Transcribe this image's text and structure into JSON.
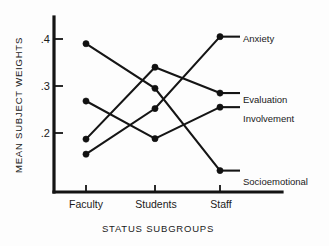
{
  "chart_data": {
    "type": "line",
    "title": "",
    "xlabel": "STATUS  SUBGROUPS",
    "ylabel": "MEAN  SUBJECT  WEIGHTS",
    "categories": [
      "Faculty",
      "Students",
      "Staff"
    ],
    "ytick_labels": [
      ".4",
      ".3",
      ".2"
    ],
    "ytick_values": [
      0.4,
      0.3,
      0.2
    ],
    "ylim": [
      0.095,
      0.455
    ],
    "grid": false,
    "legend_position": "right-inline-labels",
    "series": [
      {
        "name": "Anxiety",
        "values": [
          0.155,
          0.252,
          0.405
        ]
      },
      {
        "name": "Evaluation",
        "values": [
          0.187,
          0.34,
          0.285
        ]
      },
      {
        "name": "Involvement",
        "values": [
          0.268,
          0.188,
          0.255
        ]
      },
      {
        "name": "Socioemotional",
        "values": [
          0.39,
          0.295,
          0.12
        ]
      }
    ]
  },
  "axis": {
    "x_tick_labels": [
      "Faculty",
      "Students",
      "Staff"
    ],
    "y_tick_labels": [
      ".4",
      ".3",
      ".2"
    ],
    "x_title": "STATUS  SUBGROUPS",
    "y_title": "MEAN  SUBJECT  WEIGHTS"
  },
  "series_labels": {
    "anxiety": "Anxiety",
    "evaluation": "Evaluation",
    "involvement": "Involvement",
    "socioemotional": "Socioemotional"
  },
  "colors": {
    "ink": "#141414",
    "background": "#fdfdfd"
  }
}
